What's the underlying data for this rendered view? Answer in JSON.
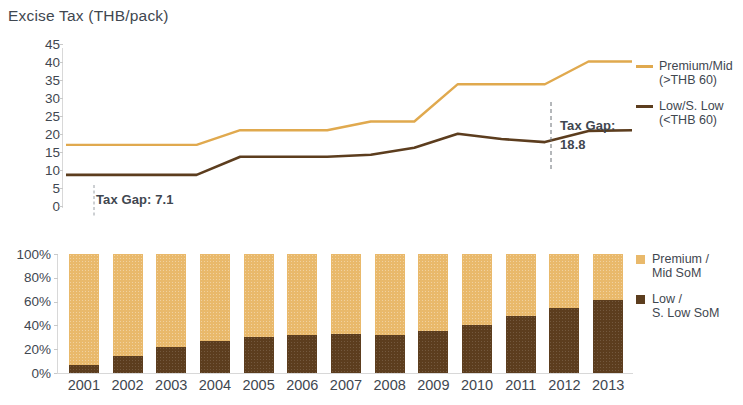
{
  "title": "Excise Tax (THB/pack)",
  "line_chart": {
    "y_ticks": [
      "45",
      "40",
      "35",
      "30",
      "25",
      "20",
      "15",
      "10",
      "5",
      "0"
    ],
    "annotations": {
      "left_gap": "Tax Gap: 7.1",
      "right_gap_line1": "Tax Gap:",
      "right_gap_line2": "18.8"
    },
    "legend": [
      {
        "label": "Premium/Mid\n(>THB 60)",
        "color": "#e0a94e",
        "name": "premium-mid"
      },
      {
        "label": "Low/S. Low\n(<THB 60)",
        "color": "#5c3d1e",
        "name": "low-s-low"
      }
    ]
  },
  "bar_chart": {
    "y_ticks": [
      "100%",
      "80%",
      "60%",
      "40%",
      "20%",
      "0%"
    ],
    "legend": [
      {
        "label": "Premium /\nMid SoM",
        "color": "#e9b96b",
        "name": "premium-mid-som"
      },
      {
        "label": "Low /\nS. Low SoM",
        "color": "#5c3d1e",
        "name": "low-s-low-som"
      }
    ]
  },
  "chart_data": [
    {
      "type": "line",
      "title": "Excise Tax (THB/pack)",
      "xlabel": "",
      "ylabel": "Excise Tax (THB/pack)",
      "ylim": [
        0,
        45
      ],
      "grid": false,
      "legend_position": "right",
      "x": [
        "2001",
        "2002",
        "2003",
        "2004",
        "2005",
        "2006",
        "2007",
        "2008",
        "2009",
        "2010",
        "2011",
        "2012",
        "2013"
      ],
      "series": [
        {
          "name": "Premium/Mid (>THB 60)",
          "color": "#e0a94e",
          "values": [
            17.8,
            17.8,
            17.8,
            17.8,
            22.0,
            22.0,
            22.0,
            24.5,
            24.5,
            35.2,
            35.2,
            35.2,
            41.7,
            41.7
          ]
        },
        {
          "name": "Low/S. Low (<THB 60)",
          "color": "#5c3d1e",
          "values": [
            9.2,
            9.2,
            9.2,
            9.2,
            14.4,
            14.4,
            14.4,
            15.0,
            17.0,
            21.0,
            19.5,
            18.6,
            21.8,
            22.0
          ]
        }
      ],
      "annotations": [
        {
          "text": "Tax Gap: 7.1",
          "x": "2001",
          "value": 7.1
        },
        {
          "text": "Tax Gap: 18.8",
          "x": "2013",
          "value": 18.8
        }
      ]
    },
    {
      "type": "bar",
      "stacked": true,
      "title": "",
      "xlabel": "",
      "ylabel": "",
      "ylim": [
        0,
        100
      ],
      "grid": false,
      "legend_position": "right",
      "categories": [
        "2001",
        "2002",
        "2003",
        "2004",
        "2005",
        "2006",
        "2007",
        "2008",
        "2009",
        "2010",
        "2011",
        "2012",
        "2013"
      ],
      "series": [
        {
          "name": "Low / S. Low SoM",
          "color": "#5c3d1e",
          "values": [
            7,
            14,
            22,
            27,
            30,
            32,
            33,
            32,
            35,
            40,
            48,
            55,
            61
          ]
        },
        {
          "name": "Premium / Mid SoM",
          "color": "#e9b96b",
          "values": [
            93,
            86,
            78,
            73,
            70,
            68,
            67,
            68,
            65,
            60,
            52,
            45,
            39
          ]
        }
      ]
    }
  ],
  "x_labels": [
    "2001",
    "2002",
    "2003",
    "2004",
    "2005",
    "2006",
    "2007",
    "2008",
    "2009",
    "2010",
    "2011",
    "2012",
    "2013"
  ]
}
